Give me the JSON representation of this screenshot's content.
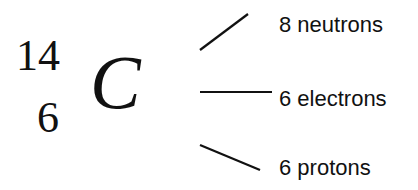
{
  "isotope": {
    "mass_number": "14",
    "atomic_number": "6",
    "symbol": "C"
  },
  "labels": {
    "neutrons": "8 neutrons",
    "electrons": "6 electrons",
    "protons": "6 protons"
  }
}
